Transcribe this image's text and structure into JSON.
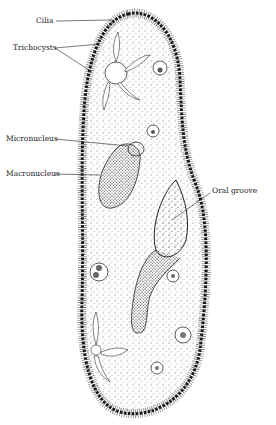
{
  "figure": {
    "labels": {
      "cilia": "Cilia",
      "trichocysts": "Trichocysts",
      "micronucleus": "Micronucleus",
      "macronucleus": "Macronucleus",
      "oral_groove": "Oral groove"
    }
  },
  "colors": {
    "ink": "#1a1a1a",
    "background": "#ffffff",
    "stipple": "#555555"
  }
}
